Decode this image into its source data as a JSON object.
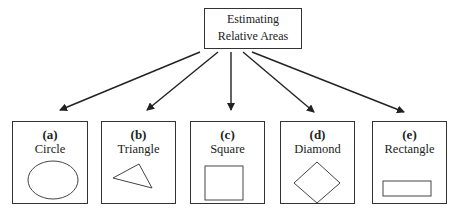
{
  "root": {
    "line1": "Estimating",
    "line2": "Relative Areas"
  },
  "cards": [
    {
      "letter": "(a)",
      "name": "Circle",
      "shape": "circle-icon"
    },
    {
      "letter": "(b)",
      "name": "Triangle",
      "shape": "triangle-icon"
    },
    {
      "letter": "(c)",
      "name": "Square",
      "shape": "square-icon"
    },
    {
      "letter": "(d)",
      "name": "Diamond",
      "shape": "diamond-icon"
    },
    {
      "letter": "(e)",
      "name": "Rectangle",
      "shape": "rectangle-icon"
    }
  ],
  "colors": {
    "stroke": "#333333",
    "background": "#ffffff"
  }
}
